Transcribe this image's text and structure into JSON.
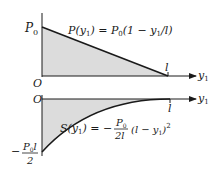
{
  "top_plot": {
    "y_axis_label": "P",
    "y_axis_label_sub": "0",
    "origin_label": "O",
    "x_axis_label": "y",
    "x_axis_label_sub": "1",
    "x_end_label": "l",
    "equation": {
      "lhs": "P(y",
      "lhs_sub": "1",
      "lhs_close": ")",
      "eq": " = ",
      "rhs_P": "P",
      "rhs_P_sub": "0",
      "rhs_paren": "(1 − y",
      "rhs_sub": "1",
      "rhs_close": "/l)"
    },
    "fill_color": "#d9d9d9",
    "line_color": "#1a1a1a"
  },
  "bottom_plot": {
    "origin_label": "O",
    "x_axis_label": "y",
    "x_axis_label_sub": "1",
    "x_end_label": "l",
    "min_label_sign": "−",
    "min_label_num": "P",
    "min_label_num_sub": "0",
    "min_label_num_l": "l",
    "min_label_den": "2",
    "equation": {
      "lhs": "S(y",
      "lhs_sub": "1",
      "lhs_close": ")",
      "eq": " = −",
      "frac_num": "P",
      "frac_num_sub": "0",
      "frac_den": "2l",
      "tail": "(l − y",
      "tail_sub": "1",
      "tail_close": ")",
      "tail_sup": "2"
    },
    "fill_color": "#d9d9d9",
    "line_color": "#1a1a1a"
  }
}
